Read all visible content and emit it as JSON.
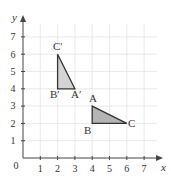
{
  "axes": {
    "x_label": "x",
    "y_label": "y",
    "origin_label": "0",
    "x_ticks": [
      "1",
      "2",
      "3",
      "4",
      "5",
      "6",
      "7"
    ],
    "y_ticks": [
      "1",
      "2",
      "3",
      "4",
      "5",
      "6",
      "7"
    ]
  },
  "triangles": [
    {
      "name": "ABC",
      "fill": "#b4b4b4",
      "vertices": [
        {
          "label": "A",
          "x": 4,
          "y": 3
        },
        {
          "label": "B",
          "x": 4,
          "y": 2
        },
        {
          "label": "C",
          "x": 6,
          "y": 2
        }
      ]
    },
    {
      "name": "A'B'C'",
      "fill": "#d4d4d4",
      "vertices": [
        {
          "label": "A′",
          "x": 3,
          "y": 4
        },
        {
          "label": "B′",
          "x": 2,
          "y": 4
        },
        {
          "label": "C′",
          "x": 2,
          "y": 6
        }
      ]
    }
  ],
  "colors": {
    "grid": "#e4e4e4",
    "axis": "#444444",
    "outline": "#333333"
  }
}
